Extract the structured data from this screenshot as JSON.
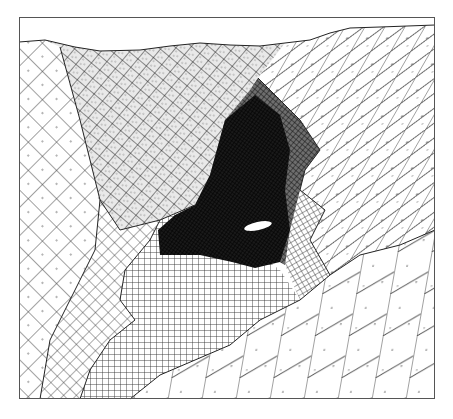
{
  "diagram": {
    "type": "finite-element-mesh",
    "frame": {
      "x": 19,
      "y": 17,
      "width": 416,
      "height": 382
    },
    "surface_profile": [
      [
        19,
        42
      ],
      [
        45,
        40
      ],
      [
        75,
        47
      ],
      [
        100,
        51
      ],
      [
        140,
        50
      ],
      [
        170,
        46
      ],
      [
        200,
        43
      ],
      [
        230,
        45
      ],
      [
        260,
        46
      ],
      [
        285,
        43
      ],
      [
        310,
        40
      ],
      [
        330,
        33
      ],
      [
        350,
        28
      ],
      [
        380,
        27
      ],
      [
        435,
        25
      ]
    ],
    "regions": [
      {
        "name": "left-coarse-diagonal",
        "pattern": "diamond-coarse"
      },
      {
        "name": "upper-left-fine-stippled",
        "pattern": "diamond-fine"
      },
      {
        "name": "right-coarse-diagonal",
        "pattern": "diagonal-coarse"
      },
      {
        "name": "central-dense-core",
        "pattern": "dense"
      },
      {
        "name": "lower-left-orthogonal",
        "pattern": "square-grid"
      },
      {
        "name": "left-middle-diamond",
        "pattern": "diamond-medium"
      },
      {
        "name": "lower-right-skewed",
        "pattern": "skewed-coarse"
      },
      {
        "name": "right-mid-fine-grid",
        "pattern": "square-grid-fine"
      }
    ],
    "colors": {
      "line": "#3a3a3a",
      "dense": "#0a0a0a",
      "background": "#ffffff"
    }
  }
}
